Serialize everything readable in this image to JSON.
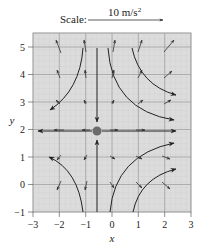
{
  "figure": {
    "type": "vector-field-diagram",
    "scale": {
      "label": "Scale:",
      "value": "10 m/s",
      "superscript": "2"
    },
    "axes": {
      "xlabel": "x",
      "ylabel": "y",
      "xlim": [
        -3,
        3
      ],
      "ylim": [
        -1,
        5.5
      ],
      "x_ticks": [
        "−3",
        "−2",
        "−1",
        "0",
        "1",
        "2",
        "3"
      ],
      "y_ticks": [
        "−1",
        "0",
        "1",
        "2",
        "3",
        "4",
        "5"
      ],
      "grid": true
    },
    "center_point": {
      "x": -0.5,
      "y": 2,
      "color": "#6b6b6b"
    },
    "colors": {
      "background": "#d9d9d9",
      "grid": "#9a9a9a",
      "arrow": "#333333",
      "curve": "#222222"
    },
    "small_arrows_grid": {
      "x": [
        -2,
        -1,
        0,
        1,
        2
      ],
      "y": [
        0,
        1,
        2,
        3,
        4,
        5
      ]
    },
    "streamlines": [
      {
        "name": "upper-left",
        "from": [
          -1,
          5
        ],
        "to": [
          -2.4,
          2.8
        ]
      },
      {
        "name": "upper-right-outer",
        "from": [
          0.5,
          5
        ],
        "to": [
          2.3,
          3.0
        ]
      },
      {
        "name": "upper-right-inner",
        "from": [
          -0.2,
          5
        ],
        "to": [
          2.3,
          2.3
        ]
      },
      {
        "name": "lower-left",
        "from": [
          -1,
          -1
        ],
        "to": [
          -2.3,
          1.1
        ]
      },
      {
        "name": "lower-right-inner",
        "from": [
          -0.1,
          -1
        ],
        "to": [
          2.2,
          1.5
        ]
      },
      {
        "name": "lower-right-outer",
        "from": [
          0.8,
          -1
        ],
        "to": [
          2.3,
          1.0
        ]
      },
      {
        "name": "vertical-down",
        "from": [
          -0.5,
          5
        ],
        "to": [
          -0.5,
          2.3
        ]
      },
      {
        "name": "vertical-up",
        "from": [
          -0.5,
          -1
        ],
        "to": [
          -0.5,
          1.7
        ]
      },
      {
        "name": "horizontal-left",
        "from": [
          -0.5,
          2
        ],
        "to": [
          -2.8,
          2
        ]
      },
      {
        "name": "horizontal-right",
        "from": [
          -0.5,
          2
        ],
        "to": [
          2.4,
          2
        ]
      }
    ]
  }
}
